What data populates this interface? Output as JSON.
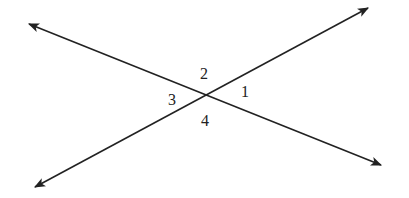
{
  "diagram": {
    "intersection": {
      "x": 207,
      "y": 97
    },
    "lines": [
      {
        "name": "line-a",
        "from": {
          "x": 29,
          "y": 24
        },
        "to": {
          "x": 381,
          "y": 165
        },
        "arrows": "both"
      },
      {
        "name": "line-b",
        "from": {
          "x": 35,
          "y": 187
        },
        "to": {
          "x": 368,
          "y": 8
        },
        "arrows": "both"
      }
    ],
    "stroke_color": "#222222",
    "angles": [
      {
        "label": "1",
        "x": 241,
        "y": 84
      },
      {
        "label": "2",
        "x": 200,
        "y": 66
      },
      {
        "label": "3",
        "x": 168,
        "y": 92
      },
      {
        "label": "4",
        "x": 201,
        "y": 113
      }
    ]
  }
}
